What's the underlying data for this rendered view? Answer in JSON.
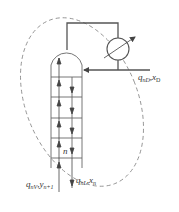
{
  "diagram": {
    "type": "distillation-column-rectifying-section",
    "colors": {
      "line": "#555555",
      "dashed_boundary": "#888888",
      "text": "#333333"
    },
    "labels": {
      "distillate": {
        "q": "q",
        "q_sub": "nD",
        "sep": ",",
        "x": "x",
        "x_sub": "D"
      },
      "vapor_in": {
        "q": "q",
        "q_sub": "nV",
        "sep": ",",
        "y": "y",
        "y_sub": "n+1"
      },
      "liquid_out": {
        "q": "q",
        "q_sub": "nL",
        "sep": ",",
        "x": "x",
        "x_sub": "n"
      },
      "plate": "n"
    },
    "components": [
      {
        "id": "column",
        "label": "rectifying column with trays"
      },
      {
        "id": "condenser",
        "label": "condenser (heat exchanger)"
      },
      {
        "id": "reflux-line",
        "label": "reflux return"
      },
      {
        "id": "control-boundary",
        "label": "dashed material-balance envelope"
      }
    ],
    "tray_count_visible": 5
  }
}
